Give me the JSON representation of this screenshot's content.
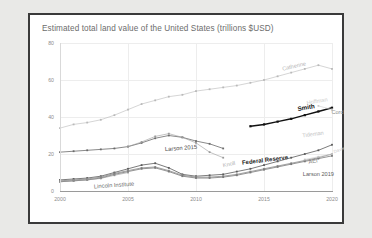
{
  "chart": {
    "title": "Estimated total land value of the United States (trillions $USD)",
    "xticks": [
      "2000",
      "2005",
      "2010",
      "2015",
      "2020"
    ],
    "yticks": [
      "0",
      "20",
      "40",
      "60",
      "80"
    ]
  },
  "labels": {
    "catherine": "Catherine",
    "cord": "Cord",
    "hoffman": "Hoffman",
    "smith": "Smith",
    "tideman": "Tideman",
    "federal_reserve": "Federal Reserve",
    "aei": "AEI",
    "larson2019": "Larson 2019",
    "larson2015": "Larson 2015",
    "knoll": "Knoll",
    "lincoln": "Lincoln Institute",
    "davis": "Davis"
  },
  "chart_data": {
    "type": "line",
    "title": "Estimated total land value of the United States (trillions $USD)",
    "xlabel": "",
    "ylabel": "",
    "xlim": [
      2000,
      2020
    ],
    "ylim": [
      0,
      80
    ],
    "xticks": [
      2000,
      2005,
      2010,
      2015,
      2020
    ],
    "yticks": [
      0,
      20,
      40,
      60,
      80
    ],
    "grid": true,
    "legend": "inline-annotations",
    "series": [
      {
        "name": "Catherine",
        "color": "#b9b9b9",
        "weight": "light",
        "x": [
          2000,
          2001,
          2002,
          2003,
          2004,
          2005,
          2006,
          2007,
          2008,
          2009,
          2010,
          2011,
          2012,
          2013,
          2014,
          2015,
          2016,
          2017,
          2018,
          2019,
          2020
        ],
        "values": [
          34,
          36,
          37,
          38.5,
          41,
          44,
          47,
          49,
          51,
          52,
          54,
          55,
          56,
          57,
          58.5,
          60,
          62,
          64,
          66,
          68,
          66
        ]
      },
      {
        "name": "Smith",
        "color": "#111111",
        "weight": "bold",
        "x": [
          2014,
          2015,
          2016,
          2017,
          2018,
          2019,
          2020
        ],
        "values": [
          35,
          36,
          37.5,
          39,
          41,
          43,
          45
        ]
      },
      {
        "name": "Cord",
        "color": "#aaaaaa",
        "weight": "light",
        "x": [
          2020
        ],
        "values": [
          44
        ]
      },
      {
        "name": "Hoffman",
        "color": "#cccccc",
        "weight": "light",
        "x": [
          2019,
          2020
        ],
        "values": [
          46,
          44
        ]
      },
      {
        "name": "Larson 2015",
        "color": "#6b6b6b",
        "weight": "medium",
        "x": [
          2000,
          2001,
          2002,
          2003,
          2004,
          2005,
          2006,
          2007,
          2008,
          2009,
          2010,
          2011,
          2012
        ],
        "values": [
          21,
          21.5,
          22,
          22.5,
          23,
          24,
          26,
          28.5,
          30,
          29,
          27,
          25.5,
          23
        ]
      },
      {
        "name": "Knoll",
        "color": "#9a9a9a",
        "weight": "light",
        "x": [
          2005,
          2006,
          2007,
          2008,
          2009,
          2010,
          2011,
          2012
        ],
        "values": [
          24,
          26.5,
          29.5,
          31,
          29,
          26,
          21,
          18
        ]
      },
      {
        "name": "Federal Reserve",
        "color": "#5a5a5a",
        "weight": "medium",
        "x": [
          2000,
          2001,
          2002,
          2003,
          2004,
          2005,
          2006,
          2007,
          2008,
          2009,
          2010,
          2011,
          2012,
          2013,
          2014,
          2015,
          2016,
          2017,
          2018,
          2019,
          2020
        ],
        "values": [
          6,
          6.5,
          7,
          8,
          10,
          12,
          14,
          15,
          12.5,
          9,
          8,
          8.5,
          9,
          10.5,
          12,
          14,
          16,
          18,
          20,
          22,
          25
        ]
      },
      {
        "name": "AEI",
        "color": "#8a8a8a",
        "weight": "medium",
        "x": [
          2000,
          2001,
          2002,
          2003,
          2004,
          2005,
          2006,
          2007,
          2008,
          2009,
          2010,
          2011,
          2012,
          2013,
          2014,
          2015,
          2016,
          2017,
          2018,
          2019,
          2020
        ],
        "values": [
          5.5,
          6,
          6.5,
          7.5,
          9.5,
          11,
          12.5,
          13,
          11,
          8.5,
          7.5,
          7.5,
          8,
          9,
          10.5,
          12,
          13.5,
          15,
          16.5,
          18,
          20
        ]
      },
      {
        "name": "Larson 2019",
        "color": "#7a7a7a",
        "weight": "medium",
        "x": [
          2000,
          2001,
          2002,
          2003,
          2004,
          2005,
          2006,
          2007,
          2008,
          2009,
          2010,
          2011,
          2012,
          2013,
          2014,
          2015,
          2016,
          2017,
          2018,
          2019,
          2020
        ],
        "values": [
          5,
          5.5,
          6,
          7,
          9,
          10.5,
          12,
          12.5,
          10.5,
          8,
          7,
          7,
          7.5,
          8.5,
          10,
          11.5,
          13,
          14.5,
          16,
          17.5,
          19
        ]
      },
      {
        "name": "Davis",
        "color": "#c4c4c4",
        "weight": "light",
        "x": [
          2018,
          2019,
          2020
        ],
        "values": [
          17,
          18.5,
          20
        ]
      },
      {
        "name": "Lincoln Institute",
        "color": "#8f8f8f",
        "weight": "light",
        "x": [
          2000,
          2001,
          2002,
          2003,
          2004,
          2005
        ],
        "values": [
          5,
          5.5,
          6,
          6.8,
          8.5,
          10
        ]
      }
    ],
    "annotations": [
      {
        "text": "Catherine",
        "x": 2017.2,
        "y": 67.5,
        "color": "#b6b6b6",
        "rotate": -13,
        "size": 5.6
      },
      {
        "text": "Cord",
        "x": 2020.4,
        "y": 42.5,
        "color": "#8e8e8e",
        "rotate": 0,
        "size": 5.6
      },
      {
        "text": "Hoffman",
        "x": 2018.9,
        "y": 48.5,
        "color": "#cdcdcd",
        "rotate": -10,
        "size": 5.6
      },
      {
        "text": "Smith",
        "x": 2018.1,
        "y": 45.5,
        "color": "#111111",
        "rotate": -10,
        "size": 6.2
      },
      {
        "text": "Tideman",
        "x": 2018.6,
        "y": 31.0,
        "color": "#c3c3c3",
        "rotate": -8,
        "size": 5.6
      },
      {
        "text": "Federal Reserve",
        "x": 2015.1,
        "y": 16.5,
        "color": "#1c1c1c",
        "rotate": -7,
        "size": 6.0
      },
      {
        "text": "AEI",
        "x": 2018.6,
        "y": 16.0,
        "color": "#7f7f7f",
        "rotate": -9,
        "size": 5.6
      },
      {
        "text": "Larson 2019",
        "x": 2019.0,
        "y": 9.0,
        "color": "#5d5d5d",
        "rotate": 0,
        "size": 5.6
      },
      {
        "text": "Larson 2015",
        "x": 2008.9,
        "y": 23.0,
        "color": "#4a4a4a",
        "rotate": -4,
        "size": 5.8
      },
      {
        "text": "Knoll",
        "x": 2012.4,
        "y": 14.5,
        "color": "#b0b0b0",
        "rotate": -12,
        "size": 5.6
      },
      {
        "text": "Lincoln Institute",
        "x": 2004.0,
        "y": 3.2,
        "color": "#6e6e6e",
        "rotate": -4,
        "size": 5.8
      },
      {
        "text": "Davis",
        "x": 2020.5,
        "y": 22.0,
        "color": "#cacaca",
        "rotate": -20,
        "size": 4.4
      }
    ]
  }
}
